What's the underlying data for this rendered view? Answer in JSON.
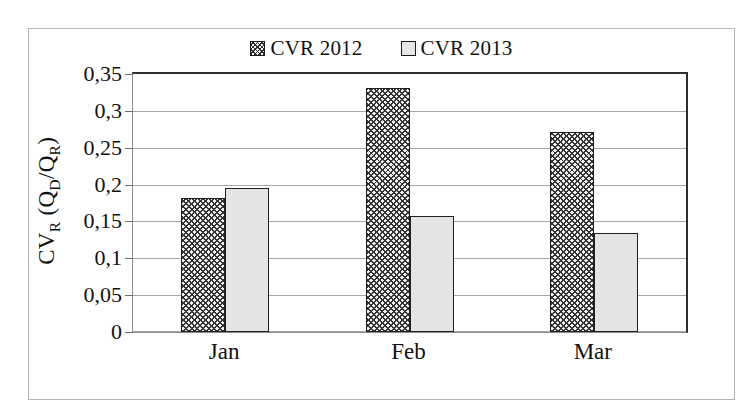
{
  "chart_data": {
    "type": "bar",
    "title": "",
    "subtitle": "",
    "xlabel": "",
    "ylabel": "CV_R (Q_D/Q_R)",
    "ylabel_parts": {
      "main1": "CV",
      "sub1": "R",
      "main2": " (Q",
      "sub2": "D",
      "main3": "/Q",
      "sub3": "R",
      "main4": ")"
    },
    "categories": [
      "Jan",
      "Feb",
      "Mar"
    ],
    "series": [
      {
        "name": "CVR 2012",
        "values": [
          0.182,
          0.331,
          0.271
        ],
        "pattern": "crosshatch"
      },
      {
        "name": "CVR 2013",
        "values": [
          0.196,
          0.158,
          0.134
        ],
        "pattern": "solid-gray"
      }
    ],
    "ylim": [
      0,
      0.35
    ],
    "ytick_values": [
      0,
      0.05,
      0.1,
      0.15,
      0.2,
      0.25,
      0.3,
      0.35
    ],
    "ytick_labels": [
      "0",
      "0,05",
      "0,1",
      "0,15",
      "0,2",
      "0,25",
      "0,3",
      "0,35"
    ],
    "decimal_separator": ",",
    "grid": true,
    "grid_axis": "y",
    "legend_position": "top-center"
  },
  "legend": {
    "entries": [
      {
        "label": "CVR 2012",
        "swatch": "crosshatch-swatch-icon"
      },
      {
        "label": "CVR 2013",
        "swatch": "gray-swatch-icon"
      }
    ]
  },
  "colors": {
    "frame_border": "#b4b4b4",
    "axis": "#2e2e2e",
    "gridline": "#a6a6a6",
    "bar_2012_fill": "#efefef",
    "bar_2012_hatch": "#333333",
    "bar_2013_fill": "#e4e4e4",
    "bar_outline": "#202020",
    "text": "#111111",
    "background": "#ffffff"
  }
}
